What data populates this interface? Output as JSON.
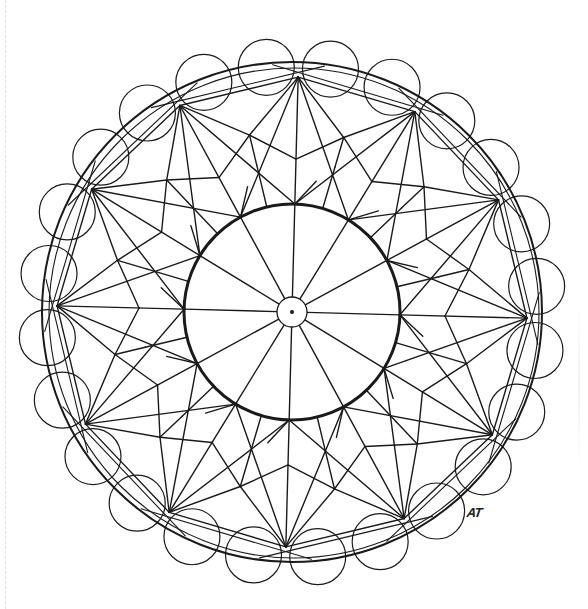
{
  "artwork": {
    "type": "mandala-line-drawing",
    "symmetry": 12,
    "signature": "AT",
    "colors": {
      "background": "#ffffff",
      "stroke": "#1a1a1a"
    },
    "center": [
      292,
      312
    ],
    "rotation_deg": 1.5,
    "hub_circle": {
      "r": 15,
      "stroke_width": 1.3
    },
    "hub_dot": {
      "r": 2
    },
    "inner_circle": {
      "r": 108,
      "stroke_width": 3
    },
    "spokes": {
      "count": 12,
      "from_r": 15,
      "to_r": 108
    },
    "star": {
      "outer_r": 235,
      "mid_r": 182,
      "v_r": 153,
      "inner_joint_r": 151,
      "stroke_width": 1.4
    },
    "outer_band": {
      "circle_r": 250,
      "circle_stroke_width": 2,
      "polygon_sides": 12,
      "scallop_count": 24,
      "scallop_r": 28,
      "scallop_center_r": 246
    }
  }
}
